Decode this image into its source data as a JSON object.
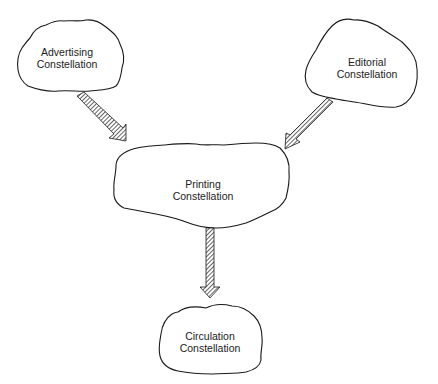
{
  "diagram": {
    "type": "flow",
    "nodes": [
      {
        "id": "advertising",
        "line1": "Advertising",
        "line2": "Constellation"
      },
      {
        "id": "editorial",
        "line1": "Editorial",
        "line2": "Constellation"
      },
      {
        "id": "printing",
        "line1": "Printing",
        "line2": "Constellation"
      },
      {
        "id": "circulation",
        "line1": "Circulation",
        "line2": "Constellation"
      }
    ],
    "edges": [
      {
        "from": "advertising",
        "to": "printing"
      },
      {
        "from": "editorial",
        "to": "printing"
      },
      {
        "from": "printing",
        "to": "circulation"
      }
    ],
    "colors": {
      "stroke": "#1a1a1a",
      "text": "#222222",
      "background": "#ffffff"
    }
  }
}
